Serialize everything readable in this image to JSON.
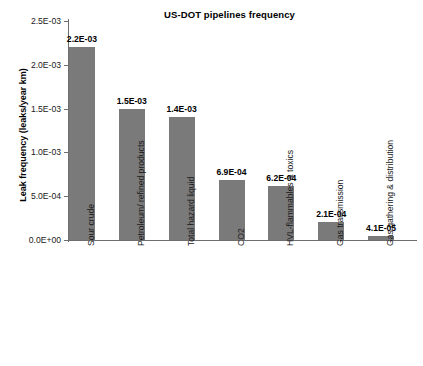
{
  "chart_data": {
    "type": "bar",
    "title": "US-DOT pipelines frequency",
    "xlabel": "",
    "ylabel": "Leak frequency (leaks/year km)",
    "ylim": [
      0,
      0.0025
    ],
    "grid": false,
    "legend": false,
    "bar_color": "#7a7a7a",
    "categories": [
      "Sour crude",
      "Petroleum/ refined products",
      "Total hazard liquid",
      "CO2",
      "HVL-flammables & toxics",
      "Gas transmission",
      "Gas gathering & distribution"
    ],
    "values": [
      0.0022,
      0.0015,
      0.0014,
      0.00069,
      0.00062,
      0.00021,
      4.1e-05
    ],
    "value_labels": [
      "2.2E-03",
      "1.5E-03",
      "1.4E-03",
      "6.9E-04",
      "6.2E-04",
      "2.1E-04",
      "4.1E-05"
    ],
    "ytick_values": [
      0.0025,
      0.002,
      0.0015,
      0.001,
      0.0005,
      0
    ],
    "ytick_labels": [
      "2.5E-03",
      "2.0E-03",
      "1.5E-03",
      "1.0E-03",
      "5.0E-04",
      "0.0E+00"
    ]
  }
}
